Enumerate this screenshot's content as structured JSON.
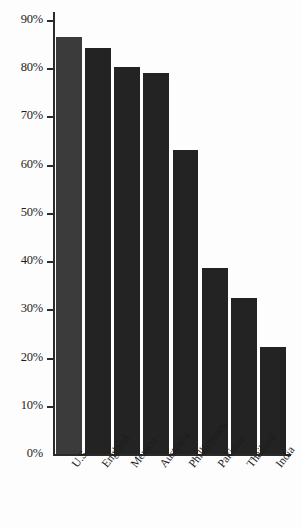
{
  "chart_data": {
    "type": "bar",
    "title": "",
    "subtitle": "",
    "xlabel": "",
    "ylabel": "",
    "categories": [
      "U.S.",
      "England",
      "Mexico",
      "Australia",
      "Phillippines",
      "Pakistan",
      "Thailand",
      "India"
    ],
    "values": [
      86.7,
      84.4,
      80.5,
      79.3,
      63.3,
      38.8,
      32.5,
      22.3
    ],
    "value_labels": [
      "",
      "",
      "",
      "",
      "",
      "",
      "",
      ""
    ],
    "ylim": [
      0,
      90
    ],
    "ytick_values": [
      0,
      10,
      20,
      30,
      40,
      50,
      60,
      70,
      80,
      90
    ],
    "ytick_labels": [
      "0%",
      "10%",
      "20%",
      "30%",
      "40%",
      "50%",
      "60%",
      "70%",
      "80%",
      "90%"
    ],
    "grid": false,
    "legend": false,
    "legend_position": "none",
    "bar_color": "#232323",
    "first_bar_color": "#3b3b3b",
    "axis_color": "#2b2b2b",
    "background_color": "#fdfdfd",
    "xtick_rotation_degrees": -52
  }
}
